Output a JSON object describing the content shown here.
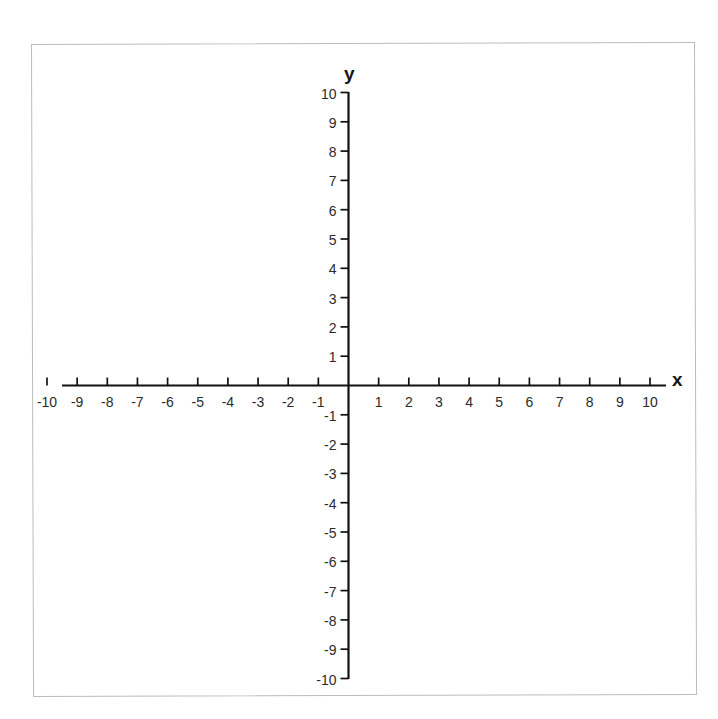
{
  "figure": {
    "title": "",
    "background_color": "#ffffff",
    "frame_color": "#b9bcc0",
    "axis_color": "#111111",
    "label_color": "#2b2b2b"
  },
  "chart_data": {
    "type": "scatter",
    "title": "",
    "xlabel": "x",
    "ylabel": "y",
    "xlim": [
      -10,
      10
    ],
    "ylim": [
      -10,
      10
    ],
    "grid": false,
    "legend": null,
    "series": [],
    "x_ticks": [
      -10,
      -9,
      -8,
      -7,
      -6,
      -5,
      -4,
      -3,
      -2,
      -1,
      1,
      2,
      3,
      4,
      5,
      6,
      7,
      8,
      9,
      10
    ],
    "y_ticks": [
      10,
      9,
      8,
      7,
      6,
      5,
      4,
      3,
      2,
      1,
      -1,
      -2,
      -3,
      -4,
      -5,
      -6,
      -7,
      -8,
      -9,
      -10
    ],
    "x_tick_labels": [
      "-10",
      "-9",
      "-8",
      "-7",
      "-6",
      "-5",
      "-4",
      "-3",
      "-2",
      "-1",
      "1",
      "2",
      "3",
      "4",
      "5",
      "6",
      "7",
      "8",
      "9",
      "10"
    ],
    "y_tick_labels": [
      "10",
      "9",
      "8",
      "7",
      "6",
      "5",
      "4",
      "3",
      "2",
      "1",
      "-1",
      "-2",
      "-3",
      "-4",
      "-5",
      "-6",
      "-7",
      "-8",
      "-9",
      "-10"
    ],
    "origin_label": ""
  },
  "axes": {
    "x_name": "x",
    "y_name": "y"
  }
}
